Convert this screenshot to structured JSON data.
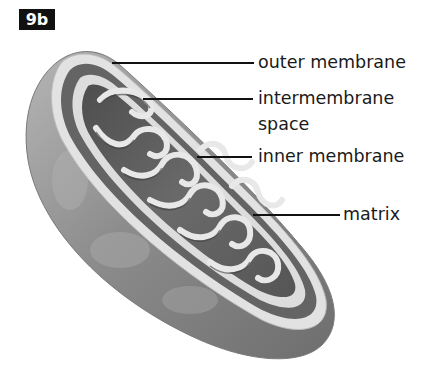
{
  "figure": {
    "badge": "9b",
    "colors": {
      "badge_bg": "#111111",
      "badge_text": "#ffffff",
      "label_text": "#1a1a1a",
      "membrane_light": "#e6e6e6",
      "outer_surface": "#8f8f8f",
      "interior_dark": "#5a5a5a"
    }
  },
  "labels": [
    {
      "id": "outer-membrane",
      "text": "outer membrane"
    },
    {
      "id": "intermembrane-space",
      "line1": "intermembrane",
      "line2": "space"
    },
    {
      "id": "inner-membrane",
      "text": "inner membrane"
    },
    {
      "id": "matrix",
      "text": "matrix"
    }
  ]
}
